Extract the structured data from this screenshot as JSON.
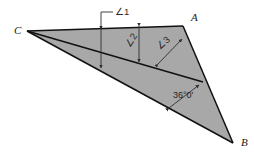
{
  "figure": {
    "type": "geometry-diagram",
    "background_color": "#ffffff",
    "fill_color": "#a8a8a8",
    "edge_color": "#111111",
    "annotation_color": "#2e2e2e"
  },
  "vertices": {
    "a": {
      "label": "A",
      "x": 183,
      "y": 26,
      "label_x": 191,
      "label_y": 21
    },
    "b": {
      "label": "B",
      "x": 233,
      "y": 143,
      "label_x": 241,
      "label_y": 146
    },
    "c": {
      "label": "C",
      "x": 27,
      "y": 31,
      "label_x": 14,
      "label_y": 34
    },
    "d": {
      "label": "",
      "x": 203,
      "y": 82
    }
  },
  "annotations": {
    "angle1": {
      "label": "∠1",
      "label_x": 115,
      "label_y": 14,
      "leader": "M 113 12 L 101 12 L 101 28",
      "dim_line": "M 101 29 L 101 68"
    },
    "angle2": {
      "label": "∠2",
      "label_x": 131,
      "label_y": 46,
      "dim_line": "M 139 26 L 139 62"
    },
    "angle3": {
      "label": "∠3",
      "label_x": 163,
      "label_y": 48,
      "dim_line": "M 158 64 L 182 39"
    },
    "measured_angle": {
      "label": "36°0'",
      "label_x": 174,
      "label_y": 95,
      "dim_line": "M 169 108 L 199 85"
    }
  }
}
